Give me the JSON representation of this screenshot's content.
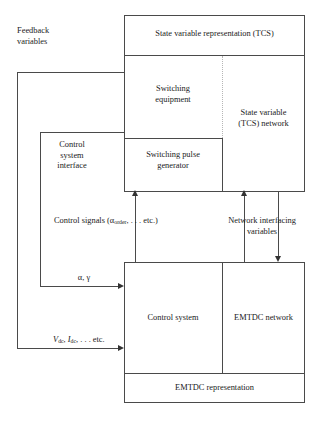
{
  "diagram": {
    "blocks": {
      "state_variable_representation": "State variable representation (TCS)",
      "switching_equipment": "Switching\nequipment",
      "state_variable_network": "State variable\n(TCS) network",
      "switching_pulse_generator": "Switching pulse\ngenerator",
      "control_system": "Control system",
      "emtdc_network": "EMTDC network",
      "emtdc_representation": "EMTDC representation"
    },
    "annotations": {
      "feedback_variables": "Feedback\nvariables",
      "control_system_interface": "Control\nsystem\ninterface",
      "control_signals": "Control signals (α",
      "control_signals_sub": "order",
      "control_signals_tail": ", . . . etc.)",
      "network_interfacing": "Network interfacing\nvariables",
      "alpha_gamma": "α, γ",
      "vdc_idc_v": "V",
      "vdc_idc_sub1": "dc",
      "vdc_idc_mid": ", ",
      "vdc_idc_i": "I",
      "vdc_idc_sub2": "dc",
      "vdc_idc_tail": ", . . . etc."
    },
    "colors": {
      "stroke": "#4a4a4a",
      "arrow": "#333333",
      "dotted": "#b6b6b6",
      "text": "#1a1a1a",
      "background": "#ffffff"
    }
  }
}
